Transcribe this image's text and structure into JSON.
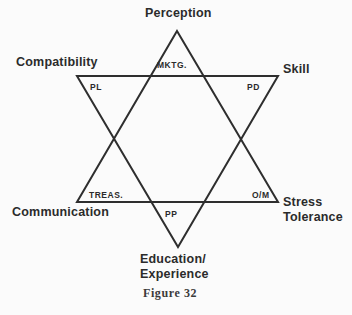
{
  "figure": {
    "caption": "Figure 32",
    "background_color": "#fbfbfb",
    "line_color": "#2e2e2e",
    "text_color": "#2b2b2b"
  },
  "diagram": {
    "type": "hexagram-star-of-david",
    "outer_labels": [
      {
        "id": "perception",
        "text": "Perception",
        "position": "top"
      },
      {
        "id": "compatibility",
        "text": "Compatibility",
        "position": "upper-left"
      },
      {
        "id": "skill",
        "text": "Skill",
        "position": "upper-right"
      },
      {
        "id": "communication",
        "text": "Communication",
        "position": "lower-left"
      },
      {
        "id": "stress",
        "text": "Stress\nTolerance",
        "position": "lower-right"
      },
      {
        "id": "education",
        "text": "Education/\nExperience",
        "position": "bottom"
      }
    ],
    "inner_labels": [
      {
        "id": "mktg",
        "text": "MKTG.",
        "position": "top-inner"
      },
      {
        "id": "pl",
        "text": "PL",
        "position": "upper-left-inner"
      },
      {
        "id": "pd",
        "text": "PD",
        "position": "upper-right-inner"
      },
      {
        "id": "treas",
        "text": "TREAS.",
        "position": "lower-left-inner"
      },
      {
        "id": "om",
        "text": "O/M",
        "position": "lower-right-inner"
      },
      {
        "id": "pp",
        "text": "PP",
        "position": "bottom-inner"
      }
    ],
    "triangles": {
      "upward": {
        "points": "177,31 278,202 77,202"
      },
      "downward": {
        "points": "77,76 278,76 178,247"
      }
    }
  }
}
